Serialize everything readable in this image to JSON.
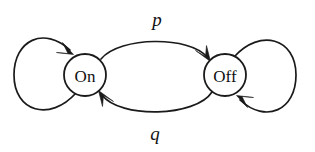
{
  "diagram": {
    "type": "state-transition-diagram",
    "title": "",
    "background_color": "#ffffff",
    "stroke_color": "#1a1a1a",
    "states": [
      {
        "id": "on",
        "label": "On",
        "cx": 85,
        "cy": 75,
        "r": 21
      },
      {
        "id": "off",
        "label": "Off",
        "cx": 225,
        "cy": 75,
        "r": 21
      }
    ],
    "transitions": [
      {
        "id": "on-to-off",
        "label": "p",
        "from": "on",
        "to": "off",
        "label_x": 157,
        "label_y": 19,
        "shape": "arc-above"
      },
      {
        "id": "off-to-on",
        "label": "q",
        "from": "off",
        "to": "on",
        "label_x": 155,
        "label_y": 133,
        "shape": "arc-below"
      },
      {
        "id": "on-self-loop",
        "label": "",
        "from": "on",
        "to": "on",
        "shape": "loop-left"
      },
      {
        "id": "off-self-loop",
        "label": "",
        "from": "off",
        "to": "off",
        "shape": "loop-right"
      }
    ]
  }
}
